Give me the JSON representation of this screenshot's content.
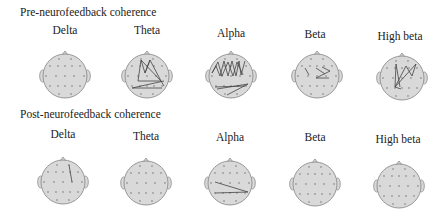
{
  "rows": [
    {
      "title": "Pre-neurofeedback coherence",
      "bands": [
        {
          "label": "Delta"
        },
        {
          "label": "Theta"
        },
        {
          "label": "Alpha"
        },
        {
          "label": "Beta"
        },
        {
          "label": "High beta"
        }
      ]
    },
    {
      "title": "Post-neurofeedback coherence",
      "bands": [
        {
          "label": "Delta"
        },
        {
          "label": "Theta"
        },
        {
          "label": "Alpha"
        },
        {
          "label": "Beta"
        },
        {
          "label": "High beta"
        }
      ]
    }
  ],
  "colors": {
    "head_fill": "#d9d9d9",
    "head_stroke": "#8c8c8c",
    "electrode": "#9a9a9a",
    "line": "#444444"
  }
}
